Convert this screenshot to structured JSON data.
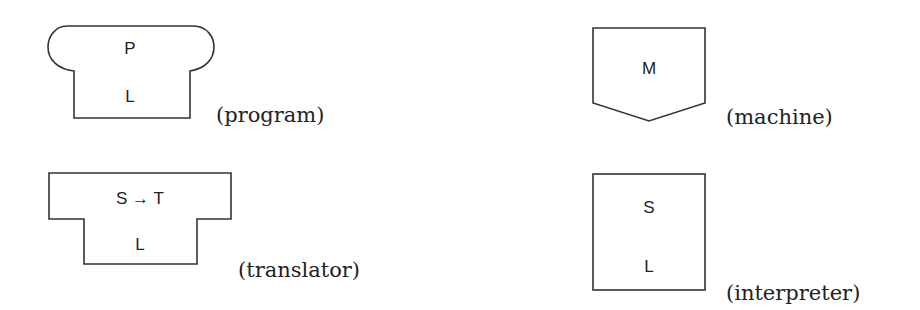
{
  "diagram": {
    "program": {
      "top_label": "P",
      "bottom_label": "L",
      "caption": "(program)"
    },
    "translator": {
      "top_label": "S → T",
      "bottom_label": "L",
      "caption": "(translator)"
    },
    "machine": {
      "label": "M",
      "caption": "(machine)"
    },
    "interpreter": {
      "top_label": "S",
      "bottom_label": "L",
      "caption": "(interpreter)"
    }
  },
  "colors": {
    "stroke": "#333333",
    "text": "#222222",
    "background": "#ffffff"
  }
}
